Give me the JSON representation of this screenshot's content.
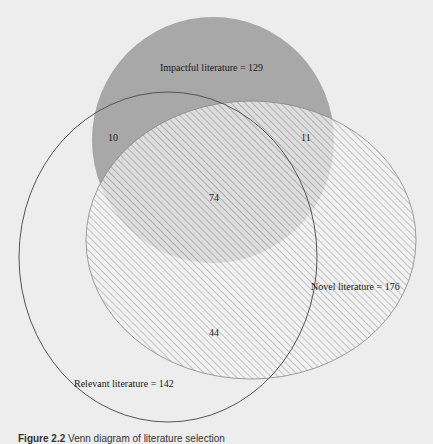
{
  "diagram": {
    "type": "venn",
    "sets": [
      {
        "id": "impactful",
        "label": "Impactful literature = 129",
        "name": "Impactful literature",
        "total": 129,
        "style": "solid-gray"
      },
      {
        "id": "relevant",
        "label": "Relevant literature = 142",
        "name": "Relevant literature",
        "total": 142,
        "style": "outline"
      },
      {
        "id": "novel",
        "label": "Novel literature = 176",
        "name": "Novel literature",
        "total": 176,
        "style": "hatched"
      }
    ],
    "regions": [
      {
        "sets": [
          "impactful",
          "relevant"
        ],
        "value": "10"
      },
      {
        "sets": [
          "impactful",
          "novel"
        ],
        "value": "11"
      },
      {
        "sets": [
          "impactful",
          "relevant",
          "novel"
        ],
        "value": "74"
      },
      {
        "sets": [
          "relevant",
          "novel"
        ],
        "value": "44"
      }
    ],
    "colors": {
      "background": "#ededed",
      "impactful_fill": "#a8a8a8",
      "hatch": "#9a9a9a",
      "outline": "#555555"
    }
  },
  "caption": {
    "figure_number": "Figure 2.2",
    "text": "Venn diagram of literature selection"
  }
}
